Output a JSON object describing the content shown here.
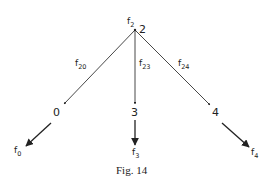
{
  "figure": {
    "caption": "Fig. 14",
    "nodes": [
      {
        "id": "2",
        "label": "2",
        "flow_label": "f",
        "flow_sub": "2"
      },
      {
        "id": "0",
        "label": "0",
        "flow_label": "f",
        "flow_sub": "0"
      },
      {
        "id": "3",
        "label": "3",
        "flow_label": "f",
        "flow_sub": "3"
      },
      {
        "id": "4",
        "label": "4",
        "flow_label": "f",
        "flow_sub": "4"
      }
    ],
    "edges": [
      {
        "from": "2",
        "to": "0",
        "label": "f",
        "sub": "20"
      },
      {
        "from": "2",
        "to": "3",
        "label": "f",
        "sub": "23"
      },
      {
        "from": "2",
        "to": "4",
        "label": "f",
        "sub": "24"
      }
    ],
    "colors": {
      "ink": "#222222",
      "background": "#ffffff"
    }
  }
}
